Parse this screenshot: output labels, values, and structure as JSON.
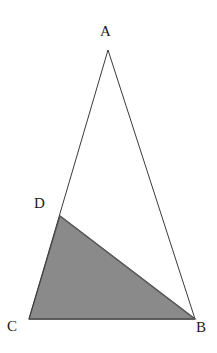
{
  "figure": {
    "canvas": {
      "width": 217,
      "height": 353
    },
    "background_color": "#ffffff",
    "stroke_color": "#3a3a3a",
    "stroke_width": 1,
    "shaded_fill_color": "#8a8a8a",
    "shaded_stroke_color": "#5a5a5a",
    "points": {
      "A": {
        "label": "A",
        "x": 108,
        "y": 50,
        "label_x": 100,
        "label_y": 24
      },
      "B": {
        "label": "B",
        "x": 195,
        "y": 319,
        "label_x": 196,
        "label_y": 320
      },
      "C": {
        "label": "C",
        "x": 29,
        "y": 319,
        "label_x": 7,
        "label_y": 319
      },
      "D": {
        "label": "D",
        "x": 60,
        "y": 216,
        "label_x": 34,
        "label_y": 196
      }
    },
    "outline_triangle": {
      "name": "triangle-ABC",
      "vertices": "A,B,C",
      "points_attr": "108,50 195,319 29,319"
    },
    "shaded_triangle": {
      "name": "triangle-DCB",
      "vertices": "D,C,B",
      "points_attr": "60,216 29,319 195,319"
    },
    "segments": [
      {
        "name": "segment-AB",
        "from": "A",
        "to": "B"
      },
      {
        "name": "segment-AC",
        "from": "A",
        "to": "C"
      },
      {
        "name": "segment-CB",
        "from": "C",
        "to": "B"
      },
      {
        "name": "segment-DB",
        "from": "D",
        "to": "B"
      }
    ]
  }
}
